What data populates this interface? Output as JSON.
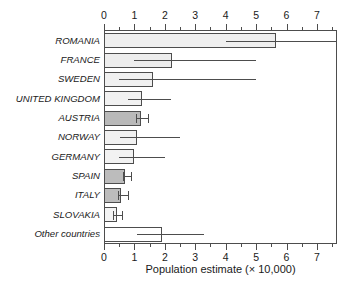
{
  "chart_data": {
    "type": "bar",
    "orientation": "horizontal",
    "title": "",
    "xlabel": "Population estimate (× 10,000)",
    "ylabel": "",
    "xlim": [
      0,
      7.66
    ],
    "xticks": [
      0,
      1,
      2,
      3,
      4,
      5,
      6,
      7
    ],
    "xticklabels": [
      "0",
      "1",
      "2",
      "3",
      "4",
      "5",
      "6",
      "7"
    ],
    "minor_tick_step": 0.5,
    "grid": false,
    "legend": null,
    "axes_on": [
      "top",
      "bottom"
    ],
    "categories": [
      "ROMANIA",
      "FRANCE",
      "SWEDEN",
      "UNITED KINGDOM",
      "AUSTRIA",
      "NORWAY",
      "GERMANY",
      "SPAIN",
      "ITALY",
      "SLOVAKIA",
      "Other countries"
    ],
    "values": [
      5.65,
      2.25,
      1.6,
      1.25,
      1.2,
      1.1,
      1.0,
      0.7,
      0.57,
      0.42,
      1.9
    ],
    "error_low": [
      4.0,
      1.0,
      0.5,
      0.78,
      1.05,
      0.52,
      0.5,
      0.62,
      0.47,
      0.3,
      1.1
    ],
    "error_high": [
      7.66,
      5.0,
      5.0,
      2.2,
      1.45,
      2.5,
      2.0,
      0.9,
      0.8,
      0.6,
      3.3
    ],
    "error_high_clipped": [
      true,
      false,
      false,
      false,
      false,
      false,
      false,
      false,
      false,
      false,
      false
    ],
    "error_caps": [
      false,
      false,
      false,
      false,
      true,
      false,
      false,
      true,
      true,
      true,
      false
    ],
    "bar_fills": [
      "#efefef",
      "#ededed",
      "#f0f0f0",
      "#f1f1f1",
      "#b9b9b9",
      "#f1f1f1",
      "#f2f2f2",
      "#bcbcbc",
      "#bcbcbc",
      "#f3f3f3",
      "#ffffff"
    ],
    "bar_edge_color": "#4d4d4d",
    "error_color": "#4d4d4d",
    "axis_color": "#4d4d4d",
    "text_color": "#1a1a1a",
    "background": "#ffffff"
  }
}
